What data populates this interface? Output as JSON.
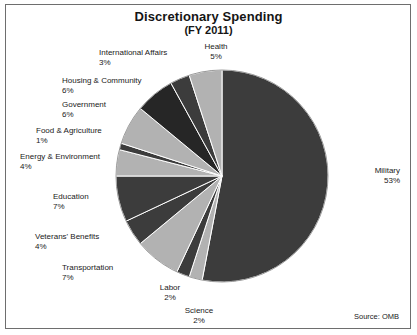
{
  "chart_data": {
    "type": "pie",
    "title": "Discretionary Spending",
    "subtitle": "(FY 2011)",
    "xlabel": "",
    "ylabel": "",
    "legend_position": "none",
    "grid": false,
    "units": "percent",
    "start_angle_deg": 0,
    "direction": "clockwise",
    "source_note": "Source: OMB",
    "categories": [
      "Military",
      "Science",
      "Labor",
      "Transportation",
      "Veterans' Benefits",
      "Education",
      "Energy & Environment",
      "Food & Agriculture",
      "Government",
      "Housing & Community",
      "International Affairs",
      "Health"
    ],
    "values": [
      53,
      2,
      2,
      7,
      4,
      7,
      4,
      1,
      6,
      6,
      3,
      5
    ],
    "value_labels": [
      "53%",
      "2%",
      "2%",
      "7%",
      "4%",
      "7%",
      "4%",
      "1%",
      "6%",
      "6%",
      "3%",
      "5%"
    ],
    "slice_colors": [
      "#3c3c3c",
      "#b2b2b2",
      "#3c3c3c",
      "#b2b2b2",
      "#3c3c3c",
      "#3c3c3c",
      "#b2b2b2",
      "#3c3c3c",
      "#b2b2b2",
      "#262626",
      "#3c3c3c",
      "#b2b2b2"
    ]
  },
  "colors": {
    "dark_slice": "#3c3c3c",
    "light_slice": "#b2b2b2",
    "darkest_slice": "#262626",
    "separator": "#ffffff",
    "frame": "#6e6e6e",
    "text": "#1a1a1a",
    "background": "#ffffff"
  },
  "labels": [
    {
      "name": "Health",
      "value": "5%"
    },
    {
      "name": "International Affairs",
      "value": "3%"
    },
    {
      "name": "Housing & Community",
      "value": "6%"
    },
    {
      "name": "Government",
      "value": "6%"
    },
    {
      "name": "Food & Agriculture",
      "value": "1%"
    },
    {
      "name": "Energy & Environment",
      "value": "4%"
    },
    {
      "name": "Education",
      "value": "7%"
    },
    {
      "name": "Veterans' Benefits",
      "value": "4%"
    },
    {
      "name": "Transportation",
      "value": "7%"
    },
    {
      "name": "Labor",
      "value": "2%"
    },
    {
      "name": "Science",
      "value": "2%"
    },
    {
      "name": "Military",
      "value": "53%"
    }
  ],
  "footer": {
    "source": "Source: OMB"
  }
}
